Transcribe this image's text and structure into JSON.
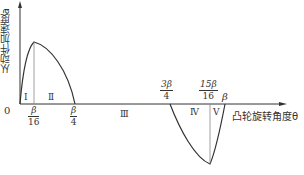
{
  "diagram": {
    "y_axis_label": "从动件加速度a",
    "x_axis_label": "凸轮旋转角度θ",
    "origin_label": "0",
    "ticks": [
      {
        "id": "b16",
        "num": "β",
        "den": "16"
      },
      {
        "id": "b4",
        "num": "β",
        "den": "4"
      },
      {
        "id": "3b4",
        "num": "3β",
        "den": "4"
      },
      {
        "id": "15b16",
        "num": "15β",
        "den": "16"
      },
      {
        "id": "b",
        "label": "β"
      }
    ],
    "regions": [
      "Ⅰ",
      "Ⅱ",
      "Ⅲ",
      "Ⅳ",
      "Ⅴ"
    ],
    "colors": {
      "line": "#333333",
      "guide": "#888888",
      "background": "#ffffff"
    }
  }
}
